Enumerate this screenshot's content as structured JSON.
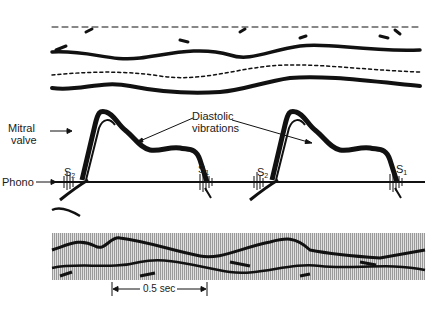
{
  "figure": {
    "type": "M-mode echocardiogram with phonocardiogram",
    "labels": {
      "mitral_valve": "Mitral\nvalve",
      "mitral_line1": "Mitral",
      "mitral_line2": "valve",
      "diastolic_line1": "Diastolic",
      "diastolic_line2": "vibrations",
      "phono": "Phono",
      "s2": "S",
      "s2_sub": "2",
      "s1": "S",
      "s1_sub": "1",
      "time_scale": "0.5 sec"
    },
    "colors": {
      "trace": "#111111",
      "background": "#ffffff",
      "stripe_band": "#bdbdbd"
    }
  }
}
